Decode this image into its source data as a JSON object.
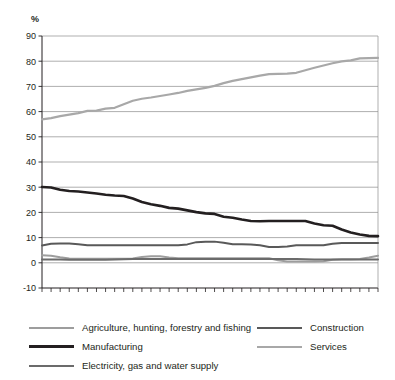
{
  "axis": {
    "unit_label": "%",
    "y_ticks": [
      90,
      80,
      70,
      60,
      50,
      40,
      30,
      20,
      10,
      0,
      -10
    ],
    "x_ticks": [
      1972,
      1974,
      1976,
      1978,
      1980,
      1982,
      1984,
      1986,
      1988,
      1990,
      1992,
      1994,
      1996,
      1998,
      2000,
      2002,
      2004,
      2006,
      2008
    ]
  },
  "legend": {
    "left": [
      {
        "label": "Agriculture, hunting, forestry and fishing",
        "swatch": "sw-thin",
        "color": "#9d9d9d"
      },
      {
        "label": "Manufacturing",
        "swatch": "sw-dark",
        "color": "#231f20"
      },
      {
        "label": "Electricity, gas and water supply",
        "swatch": "sw-mid",
        "color": "#6b6b6b"
      }
    ],
    "right": [
      {
        "label": "Construction",
        "swatch": "sw-mid",
        "color": "#595959"
      },
      {
        "label": "Services",
        "swatch": "sw-thin",
        "color": "#a8a8a8"
      }
    ]
  },
  "chart_data": {
    "type": "line",
    "title": "",
    "xlabel": "",
    "ylabel": "%",
    "ylim": [
      -10,
      90
    ],
    "xlim": [
      1971,
      2008
    ],
    "grid": true,
    "legend_position": "bottom",
    "x": [
      1971,
      1972,
      1973,
      1974,
      1975,
      1976,
      1977,
      1978,
      1979,
      1980,
      1981,
      1982,
      1983,
      1984,
      1985,
      1986,
      1987,
      1988,
      1989,
      1990,
      1991,
      1992,
      1993,
      1994,
      1995,
      1996,
      1997,
      1998,
      1999,
      2000,
      2001,
      2002,
      2003,
      2004,
      2005,
      2006,
      2007,
      2008
    ],
    "series": [
      {
        "name": "Services",
        "color": "#a8a8a8",
        "width": 2.2,
        "values": [
          56.9,
          57.4,
          58.2,
          58.8,
          59.4,
          60.3,
          60.4,
          61.2,
          61.5,
          62.9,
          64.3,
          65.1,
          65.6,
          66.2,
          66.8,
          67.4,
          68.2,
          68.8,
          69.4,
          70.2,
          71.3,
          72.2,
          72.9,
          73.6,
          74.3,
          74.9,
          75.0,
          75.1,
          75.4,
          76.4,
          77.4,
          78.3,
          79.2,
          79.9,
          80.3,
          81.1,
          81.2,
          81.3
        ]
      },
      {
        "name": "Manufacturing",
        "color": "#231f20",
        "width": 2.6,
        "values": [
          30.1,
          29.9,
          29.0,
          28.5,
          28.3,
          27.9,
          27.5,
          27.0,
          26.7,
          26.5,
          25.5,
          24.1,
          23.2,
          22.6,
          21.8,
          21.5,
          20.8,
          20.1,
          19.6,
          19.4,
          18.3,
          17.9,
          17.2,
          16.6,
          16.5,
          16.6,
          16.6,
          16.6,
          16.6,
          16.6,
          15.6,
          14.9,
          14.7,
          13.2,
          12.0,
          11.2,
          10.7,
          10.6
        ]
      },
      {
        "name": "Construction",
        "color": "#595959",
        "width": 2.0,
        "values": [
          6.9,
          7.6,
          7.7,
          7.7,
          7.4,
          7.0,
          7.0,
          7.0,
          7.0,
          7.0,
          7.0,
          7.0,
          7.0,
          7.0,
          7.0,
          7.0,
          7.3,
          8.2,
          8.4,
          8.4,
          8.0,
          7.4,
          7.4,
          7.3,
          7.0,
          6.3,
          6.3,
          6.5,
          7.0,
          7.0,
          7.0,
          7.0,
          7.6,
          7.9,
          7.9,
          7.9,
          7.9,
          7.9
        ]
      },
      {
        "name": "Agriculture, hunting, forestry and fishing",
        "color": "#9d9d9d",
        "width": 2.0,
        "values": [
          3.0,
          2.8,
          2.2,
          1.7,
          1.6,
          1.6,
          1.6,
          1.6,
          1.6,
          1.6,
          1.7,
          2.3,
          2.6,
          2.6,
          2.1,
          1.8,
          1.8,
          1.8,
          1.8,
          1.8,
          1.8,
          1.8,
          1.8,
          1.8,
          1.8,
          1.8,
          1.0,
          0.5,
          0.5,
          0.5,
          0.5,
          0.6,
          1.2,
          1.4,
          1.4,
          1.5,
          2.1,
          2.8
        ]
      },
      {
        "name": "Electricity, gas and water supply",
        "color": "#6b6b6b",
        "width": 2.0,
        "values": [
          1.3,
          1.3,
          1.3,
          1.2,
          1.2,
          1.2,
          1.2,
          1.2,
          1.3,
          1.4,
          1.5,
          1.5,
          1.5,
          1.5,
          1.5,
          1.5,
          1.5,
          1.5,
          1.5,
          1.5,
          1.5,
          1.5,
          1.5,
          1.5,
          1.5,
          1.5,
          1.5,
          1.5,
          1.5,
          1.4,
          1.3,
          1.3,
          1.3,
          1.3,
          1.3,
          1.3,
          1.3,
          1.3
        ]
      }
    ]
  }
}
